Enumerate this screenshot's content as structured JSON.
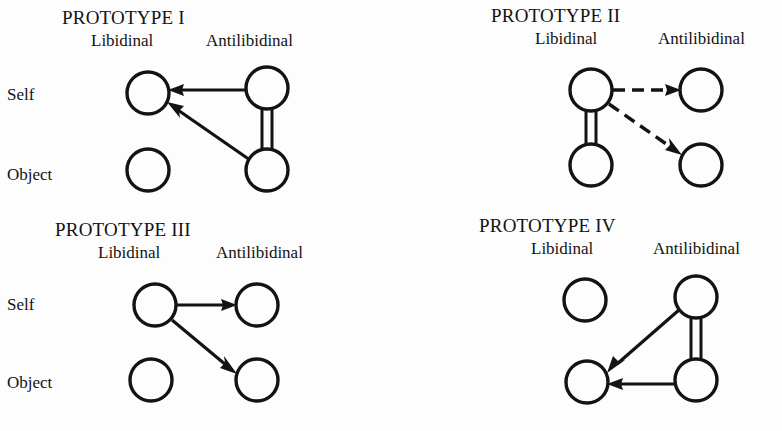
{
  "figure": {
    "background_color": "#fdfdfd",
    "ink_color": "#131313",
    "row_labels": [
      "Self",
      "Object"
    ],
    "column_headers": [
      "Libidinal",
      "Antilibidinal"
    ],
    "cut_off_caption": "Libidinal Ego and ..."
  },
  "panels": [
    {
      "id": "prototype-1",
      "title": "PROTOTYPE I",
      "columns": [
        "Libidinal",
        "Antilibidinal"
      ],
      "rows": [
        "Self",
        "Object"
      ],
      "nodes": [
        {
          "name": "libidinal-self",
          "col": "Libidinal",
          "row": "Self",
          "cx": 148,
          "cy": 93,
          "r": 21
        },
        {
          "name": "libidinal-object",
          "col": "Libidinal",
          "row": "Object",
          "cx": 148,
          "cy": 170,
          "r": 21
        },
        {
          "name": "antilibidinal-self",
          "col": "Antilibidinal",
          "row": "Self",
          "cx": 267,
          "cy": 88,
          "r": 21
        },
        {
          "name": "antilibidinal-object",
          "col": "Antilibidinal",
          "row": "Object",
          "cx": 267,
          "cy": 170,
          "r": 21
        }
      ],
      "links": [
        {
          "name": "arrow-antilib-self-to-lib-self",
          "from": "antilibidinal-self",
          "to": "libidinal-self",
          "style": "solid-arrow"
        },
        {
          "name": "arrow-antilib-object-to-lib-self",
          "from": "antilibidinal-object",
          "to": "libidinal-self",
          "style": "solid-arrow"
        },
        {
          "name": "double-bar-antilib-self-object",
          "from": "antilibidinal-self",
          "to": "antilibidinal-object",
          "style": "double-bar"
        }
      ]
    },
    {
      "id": "prototype-2",
      "title": "PROTOTYPE II",
      "columns": [
        "Libidinal",
        "Antilibidinal"
      ],
      "rows": [
        "Self",
        "Object"
      ],
      "nodes": [
        {
          "name": "libidinal-self",
          "col": "Libidinal",
          "row": "Self",
          "cx": 200,
          "cy": 90,
          "r": 21
        },
        {
          "name": "libidinal-object",
          "col": "Libidinal",
          "row": "Object",
          "cx": 200,
          "cy": 165,
          "r": 21
        },
        {
          "name": "antilibidinal-self",
          "col": "Antilibidinal",
          "row": "Self",
          "cx": 310,
          "cy": 90,
          "r": 21
        },
        {
          "name": "antilibidinal-object",
          "col": "Antilibidinal",
          "row": "Object",
          "cx": 310,
          "cy": 165,
          "r": 21
        }
      ],
      "links": [
        {
          "name": "dashed-arrow-lib-self-to-antilib-self",
          "from": "libidinal-self",
          "to": "antilibidinal-self",
          "style": "dashed-arrow"
        },
        {
          "name": "dashed-arrow-lib-self-to-antilib-object",
          "from": "libidinal-self",
          "to": "antilibidinal-object",
          "style": "dashed-arrow"
        },
        {
          "name": "double-bar-lib-self-object",
          "from": "libidinal-self",
          "to": "libidinal-object",
          "style": "double-bar"
        }
      ]
    },
    {
      "id": "prototype-3",
      "title": "PROTOTYPE III",
      "columns": [
        "Libidinal",
        "Antilibidinal"
      ],
      "rows": [
        "Self",
        "Object"
      ],
      "nodes": [
        {
          "name": "libidinal-self",
          "col": "Libidinal",
          "row": "Self",
          "cx": 155,
          "cy": 93,
          "r": 21
        },
        {
          "name": "libidinal-object",
          "col": "Libidinal",
          "row": "Object",
          "cx": 151,
          "cy": 168,
          "r": 21
        },
        {
          "name": "antilibidinal-self",
          "col": "Antilibidinal",
          "row": "Self",
          "cx": 257,
          "cy": 93,
          "r": 21
        },
        {
          "name": "antilibidinal-object",
          "col": "Antilibidinal",
          "row": "Object",
          "cx": 257,
          "cy": 168,
          "r": 21
        }
      ],
      "links": [
        {
          "name": "arrow-lib-self-to-antilib-self",
          "from": "libidinal-self",
          "to": "antilibidinal-self",
          "style": "solid-arrow"
        },
        {
          "name": "arrow-lib-self-to-antilib-object",
          "from": "libidinal-self",
          "to": "antilibidinal-object",
          "style": "solid-arrow"
        }
      ]
    },
    {
      "id": "prototype-4",
      "title": "PROTOTYPE IV",
      "columns": [
        "Libidinal",
        "Antilibidinal"
      ],
      "rows": [],
      "nodes": [
        {
          "name": "libidinal-self",
          "col": "Libidinal",
          "row": "Self",
          "cx": 194,
          "cy": 88,
          "r": 21
        },
        {
          "name": "libidinal-object",
          "col": "Libidinal",
          "row": "Object",
          "cx": 196,
          "cy": 170,
          "r": 21
        },
        {
          "name": "antilibidinal-self",
          "col": "Antilibidinal",
          "row": "Self",
          "cx": 305,
          "cy": 85,
          "r": 21
        },
        {
          "name": "antilibidinal-object",
          "col": "Antilibidinal",
          "row": "Object",
          "cx": 305,
          "cy": 168,
          "r": 21
        }
      ],
      "links": [
        {
          "name": "arrow-antilib-self-to-lib-object",
          "from": "antilibidinal-self",
          "to": "libidinal-object",
          "style": "solid-arrow"
        },
        {
          "name": "arrow-antilib-object-to-lib-object",
          "from": "antilibidinal-object",
          "to": "libidinal-object",
          "style": "solid-arrow"
        },
        {
          "name": "double-bar-antilib-self-object",
          "from": "antilibidinal-self",
          "to": "antilibidinal-object",
          "style": "double-bar"
        }
      ]
    }
  ]
}
